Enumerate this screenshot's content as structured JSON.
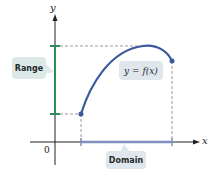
{
  "axes": {
    "x_label": "x",
    "y_label": "y",
    "origin_label": "0"
  },
  "labels": {
    "range": "Range",
    "domain": "Domain",
    "function": "y = f(x)"
  },
  "colors": {
    "curve": "#3a5a9e",
    "range_bracket": "#2e8b5a",
    "domain_bracket": "#7f8fbf",
    "range_box": "#dde9e6",
    "domain_box": "#dfe6ec",
    "axis": "#222222",
    "dashed": "#9a9a9a"
  }
}
